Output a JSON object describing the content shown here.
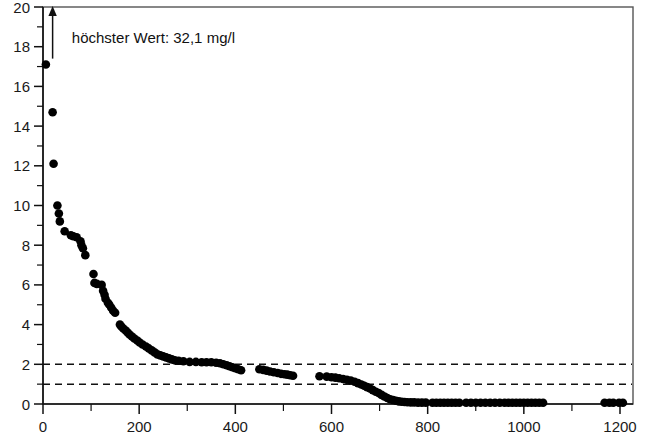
{
  "chart_data": {
    "type": "scatter",
    "title": "",
    "subtitle": "",
    "xlabel": "",
    "ylabel": "",
    "xlim": [
      0,
      1220
    ],
    "ylim": [
      0,
      20
    ],
    "grid": false,
    "legend": null,
    "x_ticks_major": [
      0,
      200,
      400,
      600,
      800,
      1000,
      1200
    ],
    "x_tick_labels": [
      "0",
      "200",
      "400",
      "600",
      "800",
      "1000",
      "1200"
    ],
    "x_ticks_minor": [
      100,
      300,
      500,
      700,
      900,
      1100
    ],
    "y_ticks_major": [
      0,
      2,
      4,
      6,
      8,
      10,
      12,
      14,
      16,
      18,
      20
    ],
    "y_tick_labels": [
      "0",
      "2",
      "4",
      "6",
      "8",
      "10",
      "12",
      "14",
      "16",
      "18",
      "20"
    ],
    "y_ticks_minor": [
      1,
      3,
      5,
      7,
      9,
      11,
      13,
      15,
      17,
      19
    ],
    "reference_lines": [
      {
        "name": "ref-line-2",
        "axis": "y",
        "value": 2,
        "style": "dashed"
      },
      {
        "name": "ref-line-1",
        "axis": "y",
        "value": 1,
        "style": "dashed"
      }
    ],
    "annotations": [
      {
        "name": "max-value-annotation",
        "text": "höchster Wert: 32,1 mg/l",
        "x": 60,
        "y": 18.2,
        "arrow": {
          "x": 20,
          "y_from": 17.4,
          "y_to": 20.0,
          "direction": "up"
        }
      }
    ],
    "marker": {
      "shape": "circle",
      "color": "#000000",
      "size_px": 5.4
    },
    "points": [
      [
        6,
        17.1
      ],
      [
        20,
        14.7
      ],
      [
        22,
        12.1
      ],
      [
        30,
        10.0
      ],
      [
        33,
        9.6
      ],
      [
        35,
        9.2
      ],
      [
        45,
        8.7
      ],
      [
        58,
        8.5
      ],
      [
        63,
        8.45
      ],
      [
        70,
        8.4
      ],
      [
        78,
        8.2
      ],
      [
        80,
        8.0
      ],
      [
        83,
        7.85
      ],
      [
        88,
        7.5
      ],
      [
        105,
        6.55
      ],
      [
        107,
        6.1
      ],
      [
        112,
        6.05
      ],
      [
        122,
        6.0
      ],
      [
        125,
        5.7
      ],
      [
        128,
        5.5
      ],
      [
        130,
        5.3
      ],
      [
        135,
        5.1
      ],
      [
        138,
        5.0
      ],
      [
        142,
        4.85
      ],
      [
        146,
        4.7
      ],
      [
        150,
        4.6
      ],
      [
        160,
        4.0
      ],
      [
        163,
        3.9
      ],
      [
        167,
        3.8
      ],
      [
        172,
        3.7
      ],
      [
        176,
        3.6
      ],
      [
        180,
        3.5
      ],
      [
        185,
        3.4
      ],
      [
        190,
        3.3
      ],
      [
        196,
        3.2
      ],
      [
        201,
        3.1
      ],
      [
        207,
        3.0
      ],
      [
        214,
        2.9
      ],
      [
        220,
        2.8
      ],
      [
        226,
        2.7
      ],
      [
        232,
        2.6
      ],
      [
        238,
        2.5
      ],
      [
        244,
        2.45
      ],
      [
        250,
        2.4
      ],
      [
        256,
        2.35
      ],
      [
        262,
        2.3
      ],
      [
        268,
        2.25
      ],
      [
        274,
        2.2
      ],
      [
        282,
        2.18
      ],
      [
        292,
        2.15
      ],
      [
        305,
        2.12
      ],
      [
        318,
        2.12
      ],
      [
        330,
        2.1
      ],
      [
        340,
        2.1
      ],
      [
        350,
        2.1
      ],
      [
        360,
        2.08
      ],
      [
        368,
        2.05
      ],
      [
        375,
        2.0
      ],
      [
        382,
        1.95
      ],
      [
        388,
        1.9
      ],
      [
        394,
        1.85
      ],
      [
        400,
        1.8
      ],
      [
        406,
        1.75
      ],
      [
        412,
        1.7
      ],
      [
        450,
        1.75
      ],
      [
        458,
        1.72
      ],
      [
        465,
        1.68
      ],
      [
        472,
        1.64
      ],
      [
        480,
        1.6
      ],
      [
        488,
        1.56
      ],
      [
        495,
        1.52
      ],
      [
        502,
        1.5
      ],
      [
        508,
        1.48
      ],
      [
        514,
        1.45
      ],
      [
        520,
        1.42
      ],
      [
        575,
        1.4
      ],
      [
        590,
        1.38
      ],
      [
        600,
        1.35
      ],
      [
        608,
        1.33
      ],
      [
        616,
        1.3
      ],
      [
        624,
        1.26
      ],
      [
        632,
        1.22
      ],
      [
        640,
        1.18
      ],
      [
        648,
        1.12
      ],
      [
        655,
        1.05
      ],
      [
        662,
        0.98
      ],
      [
        668,
        0.92
      ],
      [
        674,
        0.85
      ],
      [
        680,
        0.78
      ],
      [
        686,
        0.7
      ],
      [
        692,
        0.62
      ],
      [
        698,
        0.55
      ],
      [
        704,
        0.46
      ],
      [
        710,
        0.38
      ],
      [
        716,
        0.3
      ],
      [
        722,
        0.24
      ],
      [
        728,
        0.2
      ],
      [
        734,
        0.16
      ],
      [
        740,
        0.13
      ],
      [
        746,
        0.11
      ],
      [
        752,
        0.1
      ],
      [
        758,
        0.09
      ],
      [
        765,
        0.08
      ],
      [
        772,
        0.08
      ],
      [
        780,
        0.07
      ],
      [
        788,
        0.07
      ],
      [
        796,
        0.07
      ],
      [
        810,
        0.06
      ],
      [
        818,
        0.06
      ],
      [
        826,
        0.06
      ],
      [
        834,
        0.06
      ],
      [
        842,
        0.06
      ],
      [
        850,
        0.06
      ],
      [
        858,
        0.06
      ],
      [
        866,
        0.06
      ],
      [
        880,
        0.06
      ],
      [
        890,
        0.06
      ],
      [
        900,
        0.06
      ],
      [
        910,
        0.06
      ],
      [
        920,
        0.06
      ],
      [
        930,
        0.06
      ],
      [
        940,
        0.06
      ],
      [
        950,
        0.06
      ],
      [
        960,
        0.06
      ],
      [
        968,
        0.06
      ],
      [
        976,
        0.06
      ],
      [
        984,
        0.06
      ],
      [
        992,
        0.06
      ],
      [
        1000,
        0.06
      ],
      [
        1008,
        0.06
      ],
      [
        1016,
        0.06
      ],
      [
        1024,
        0.06
      ],
      [
        1032,
        0.06
      ],
      [
        1040,
        0.06
      ],
      [
        1168,
        0.06
      ],
      [
        1178,
        0.06
      ],
      [
        1186,
        0.06
      ],
      [
        1198,
        0.06
      ],
      [
        1206,
        0.06
      ]
    ]
  },
  "accessibility": {
    "chart_name": "concentration-rank-scatter"
  }
}
